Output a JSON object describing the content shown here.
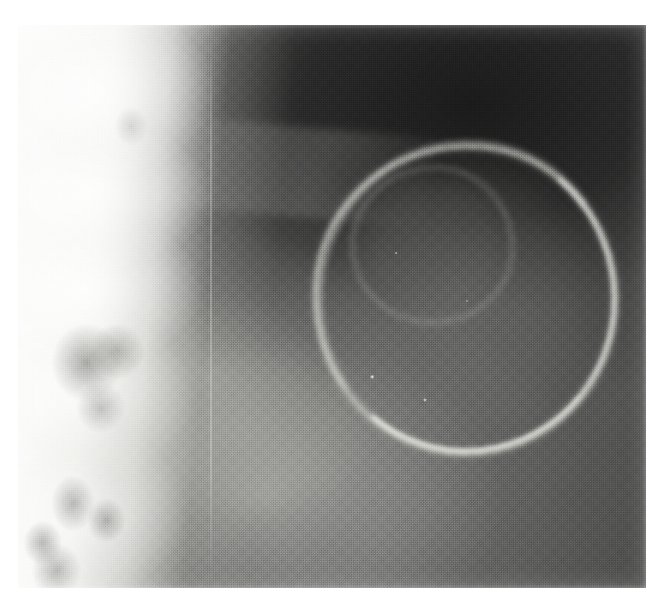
{
  "image": {
    "kind": "radiograph",
    "modality": "X-ray",
    "view": "lateral",
    "region": "lumbosacral spine and pelvis",
    "color_mode": "grayscale",
    "caption": "",
    "canvas": {
      "width_px": 665,
      "height_px": 595
    },
    "film_area": {
      "left_px": 18,
      "top_px": 25,
      "width_px": 628,
      "height_px": 563
    },
    "border": {
      "color": "#ffffff",
      "top_px": 25,
      "left_px": 18,
      "right_px": 19,
      "bottom_px": 7
    }
  },
  "palette": {
    "paper_white": "#ffffff",
    "bone_highlight": "#f6f6f4",
    "bone_mid": "#d8d8d4",
    "soft_tissue_light": "#bdbdb9",
    "soft_tissue_mid": "#7d7d7b",
    "background_gray": "#5d5d5c",
    "dark_field": "#2a2a2a",
    "darkest": "#141414",
    "calcific_rim": "#f2f2ec"
  },
  "features": [
    {
      "name": "bone-column",
      "label": "Sacrum / lumbar vertebral bodies",
      "description": "Bright radiopaque bony column occupying the left portion of the film",
      "position": "left edge to approximately 44% width, full height",
      "density": "high",
      "tone": "#f6f6f4"
    },
    {
      "name": "bone-mottle",
      "label": "Trabecular mottling and sacral foramina",
      "description": "Darker rounded lucencies within the bright bone, densest in the mid and lower thirds",
      "position": "left column, 55%-100% height",
      "density": "mixed",
      "tone": "#787874"
    },
    {
      "name": "dark-field",
      "label": "Radiolucent field",
      "description": "Broad dark region filling the upper right two thirds of the film",
      "position": "upper right quadrant",
      "density": "low",
      "tone": "#232323"
    },
    {
      "name": "round-mass",
      "label": "Large rounded mass with calcified rim",
      "description": "Ovoid structure roughly 290 px across with a thin bright curvilinear calcific rim, brightest along the inferior and right margins",
      "position": "center-right, approximately 47%-94% width and 21%-75% height",
      "density": "rim high, center intermediate",
      "tone": "#f2f2ec"
    },
    {
      "name": "inner-ring",
      "label": "Inner nested ring",
      "description": "Smaller faint ring within the superior part of the mass",
      "position": "53%-78% width, 25%-52% height",
      "density": "intermediate",
      "tone": "#c4c4be"
    },
    {
      "name": "rim-specks",
      "label": "Punctate bright calcific specks",
      "description": "Two to four tiny high-density points along and inside the inferior rim",
      "position": "56%-72% width, 40%-67% height",
      "density": "high",
      "tone": "#ffffff"
    },
    {
      "name": "soft-tissue-lower",
      "label": "Intermediate soft tissue",
      "description": "Mid-gray soft tissue plane with gently curving folds across the lower middle of the film",
      "position": "lower central band",
      "density": "intermediate",
      "tone": "#9b9b97"
    },
    {
      "name": "diagonal-streak",
      "label": "Faint oblique line",
      "description": "Thin slightly brighter oblique line crossing the upper middle dark field",
      "position": "20%-66% width, around 20% height",
      "density": "low-intermediate",
      "tone": "#96969 4"
    },
    {
      "name": "film-scratch",
      "label": "Vertical film artifact",
      "description": "Hairline vertical brighter streak running the height of the film",
      "position": "approximately 30.5% width",
      "density": "artifact",
      "tone": "#ebebe8"
    },
    {
      "name": "film-grain",
      "label": "Halftone film grain",
      "description": "Heavy reproduction grain / halftone screen texture across the entire film",
      "position": "whole film",
      "density": "texture",
      "tone": "#808080"
    }
  ]
}
